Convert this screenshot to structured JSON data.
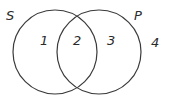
{
  "diagram": {
    "type": "venn",
    "sets": [
      {
        "name": "S",
        "cx": 55,
        "cy": 52,
        "r": 42,
        "label_x": 6,
        "label_y": 20
      },
      {
        "name": "P",
        "cx": 99,
        "cy": 52,
        "r": 42,
        "label_x": 134,
        "label_y": 20
      }
    ],
    "regions": [
      {
        "label": "1",
        "x": 40,
        "y": 45
      },
      {
        "label": "2",
        "x": 73,
        "y": 45
      },
      {
        "label": "3",
        "x": 107,
        "y": 45
      },
      {
        "label": "4",
        "x": 151,
        "y": 47
      }
    ],
    "stroke_color": "#3a3a3a"
  }
}
